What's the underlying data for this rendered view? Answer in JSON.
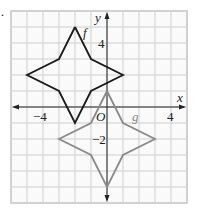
{
  "chart_data": {
    "type": "line",
    "title": "",
    "xlabel": "x",
    "ylabel": "y",
    "origin_label": "O",
    "xlim": [
      -6,
      5
    ],
    "ylim": [
      -6,
      6
    ],
    "grid": true,
    "x_ticks": [
      {
        "value": -4,
        "label": "−4"
      },
      {
        "value": 4,
        "label": "4"
      }
    ],
    "y_ticks": [
      {
        "value": 4,
        "label": "4"
      },
      {
        "value": -2,
        "label": "−2"
      }
    ],
    "series": [
      {
        "name": "f",
        "color": "#1a1a1a",
        "points": [
          [
            -2,
            5
          ],
          [
            -1,
            3
          ],
          [
            1,
            2
          ],
          [
            -1,
            1
          ],
          [
            -2,
            -1
          ],
          [
            -3,
            1
          ],
          [
            -5,
            2
          ],
          [
            -3,
            3
          ],
          [
            -2,
            5
          ]
        ]
      },
      {
        "name": "g",
        "color": "#8a8a8a",
        "points": [
          [
            0,
            1
          ],
          [
            1,
            -1
          ],
          [
            3,
            -2
          ],
          [
            1,
            -3
          ],
          [
            0,
            -5
          ],
          [
            -1,
            -3
          ],
          [
            -3,
            -2
          ],
          [
            -1,
            -1
          ],
          [
            0,
            1
          ]
        ]
      }
    ],
    "annotations": [
      {
        "text": "f",
        "near": [
          -1.5,
          5
        ]
      },
      {
        "text": "g",
        "near": [
          1.5,
          -0.4
        ]
      }
    ]
  },
  "marker": "."
}
